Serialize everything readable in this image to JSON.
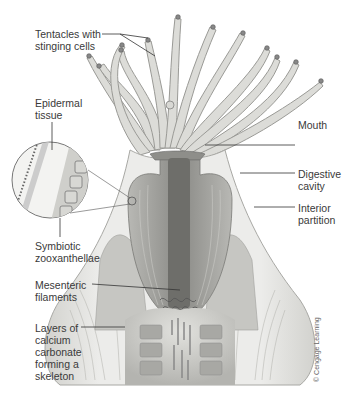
{
  "diagram": {
    "labels": {
      "tentacles": "Tentacles with\nstinging cells",
      "epidermal": "Epidermal\ntissue",
      "symbiotic": "Symbiotic\nzooxanthellae",
      "mesenteric": "Mesenteric\nfilaments",
      "layers": "Layers of\ncalcium\ncarbonate\nforming a\nskeleton",
      "mouth": "Mouth",
      "digestive": "Digestive\ncavity",
      "interior": "Interior\npartition"
    },
    "copyright": "© Cengage Learning",
    "colors": {
      "label_text": "#3a3a3a",
      "leader_line": "#333333",
      "body_fill": "#e6e6e3",
      "body_shade": "#c8c8c4",
      "cavity": "#9a9a96",
      "pharynx": "#6e6e6a"
    }
  }
}
